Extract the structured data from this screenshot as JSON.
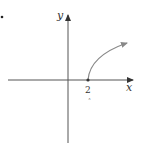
{
  "diagram": {
    "type": "function-graph",
    "axes": {
      "x_label": "x",
      "y_label": "y",
      "x_tick_label": "2",
      "below_tick_mark": "˄"
    },
    "curve": {
      "description": "square-root-type curve starting at (2,0), increasing and concave down, with arrow",
      "start_x": 2
    },
    "bullet": "•",
    "colors": {
      "axis": "#444444",
      "curve": "#888888",
      "text": "#333333"
    }
  }
}
